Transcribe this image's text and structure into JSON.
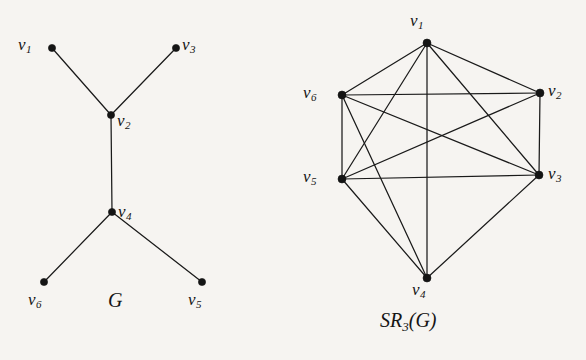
{
  "figure": {
    "background_color": "#f6f4f1",
    "ink_color": "#151515",
    "panels": [
      {
        "id": "left",
        "caption": "G",
        "caption_parts": {
          "main": "G",
          "sub": "",
          "tail": ""
        },
        "caption_x": 108,
        "caption_y": 290,
        "graph_name": "G",
        "vertices": [
          {
            "id": "v1",
            "label": "v",
            "sub": "1",
            "x": 52,
            "y": 48,
            "label_x": 18,
            "label_y": 36,
            "r": 3.6
          },
          {
            "id": "v3",
            "label": "v",
            "sub": "3",
            "x": 176,
            "y": 48,
            "label_x": 182,
            "label_y": 36,
            "r": 3.6
          },
          {
            "id": "v2",
            "label": "v",
            "sub": "2",
            "x": 111,
            "y": 115,
            "label_x": 117,
            "label_y": 112,
            "r": 3.6
          },
          {
            "id": "v4",
            "label": "v",
            "sub": "4",
            "x": 112,
            "y": 212,
            "label_x": 118,
            "label_y": 203,
            "r": 3.6
          },
          {
            "id": "v6",
            "label": "v",
            "sub": "6",
            "x": 44,
            "y": 282,
            "label_x": 28,
            "label_y": 291,
            "r": 3.6
          },
          {
            "id": "v5",
            "label": "v",
            "sub": "5",
            "x": 202,
            "y": 282,
            "label_x": 188,
            "label_y": 291,
            "r": 3.6
          }
        ],
        "edges": [
          {
            "from": "v1",
            "to": "v2"
          },
          {
            "from": "v3",
            "to": "v2"
          },
          {
            "from": "v2",
            "to": "v4"
          },
          {
            "from": "v4",
            "to": "v6"
          },
          {
            "from": "v4",
            "to": "v5"
          }
        ]
      },
      {
        "id": "right",
        "caption": "SR3(G)",
        "caption_parts": {
          "main": "SR",
          "sub": "3",
          "tail": "(G)"
        },
        "caption_x": 380,
        "caption_y": 310,
        "graph_name": "SR_3(G)",
        "vertices": [
          {
            "id": "v1",
            "label": "v",
            "sub": "1",
            "x": 427,
            "y": 43,
            "label_x": 410,
            "label_y": 12,
            "r": 4.0
          },
          {
            "id": "v6",
            "label": "v",
            "sub": "6",
            "x": 342,
            "y": 95,
            "label_x": 303,
            "label_y": 84,
            "r": 4.0
          },
          {
            "id": "v2",
            "label": "v",
            "sub": "2",
            "x": 540,
            "y": 93,
            "label_x": 548,
            "label_y": 82,
            "r": 4.0
          },
          {
            "id": "v5",
            "label": "v",
            "sub": "5",
            "x": 342,
            "y": 179,
            "label_x": 303,
            "label_y": 168,
            "r": 4.0
          },
          {
            "id": "v3",
            "label": "v",
            "sub": "3",
            "x": 539,
            "y": 175,
            "label_x": 548,
            "label_y": 165,
            "r": 4.0
          },
          {
            "id": "v4",
            "label": "v",
            "sub": "4",
            "x": 427,
            "y": 278,
            "label_x": 412,
            "label_y": 281,
            "r": 4.0
          }
        ],
        "edges": [
          {
            "from": "v1",
            "to": "v2"
          },
          {
            "from": "v1",
            "to": "v3"
          },
          {
            "from": "v1",
            "to": "v4"
          },
          {
            "from": "v1",
            "to": "v5"
          },
          {
            "from": "v1",
            "to": "v6"
          },
          {
            "from": "v2",
            "to": "v3"
          },
          {
            "from": "v2",
            "to": "v5"
          },
          {
            "from": "v2",
            "to": "v6"
          },
          {
            "from": "v3",
            "to": "v4"
          },
          {
            "from": "v3",
            "to": "v5"
          },
          {
            "from": "v3",
            "to": "v6"
          },
          {
            "from": "v4",
            "to": "v5"
          },
          {
            "from": "v4",
            "to": "v6"
          },
          {
            "from": "v5",
            "to": "v6"
          }
        ]
      }
    ]
  }
}
